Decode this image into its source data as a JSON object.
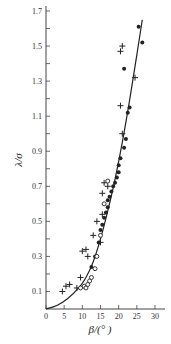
{
  "chart_data": {
    "type": "scatter",
    "title": "",
    "xlabel": "β/(°)",
    "ylabel": "λ/σ",
    "xlim": [
      0,
      32
    ],
    "ylim": [
      0,
      1.75
    ],
    "xticks": [
      0,
      5,
      10,
      15,
      20,
      25,
      30
    ],
    "yticks": [
      0.1,
      0.3,
      0.5,
      0.7,
      0.9,
      1.1,
      1.3,
      1.5,
      1.7
    ],
    "grid": false,
    "legend": null,
    "series": [
      {
        "name": "plus",
        "marker": "+",
        "points": [
          [
            4.5,
            0.1
          ],
          [
            5.5,
            0.13
          ],
          [
            6.5,
            0.14
          ],
          [
            8.5,
            0.12
          ],
          [
            9.5,
            0.18
          ],
          [
            10.0,
            0.33
          ],
          [
            11.0,
            0.34
          ],
          [
            11.5,
            0.3
          ],
          [
            13.0,
            0.42
          ],
          [
            14.0,
            0.5
          ],
          [
            15.5,
            0.54
          ],
          [
            15.5,
            0.66
          ],
          [
            17.0,
            0.7
          ],
          [
            21.0,
            1.0
          ],
          [
            20.5,
            1.16
          ],
          [
            20.5,
            1.47
          ],
          [
            21.0,
            1.5
          ],
          [
            24.5,
            1.32
          ],
          [
            15.0,
            0.38
          ],
          [
            16.0,
            0.72
          ]
        ]
      },
      {
        "name": "filled_circle",
        "marker": "●",
        "points": [
          [
            12.5,
            0.24
          ],
          [
            13.5,
            0.3
          ],
          [
            14.5,
            0.38
          ],
          [
            15.0,
            0.45
          ],
          [
            15.5,
            0.48
          ],
          [
            16.0,
            0.52
          ],
          [
            16.5,
            0.55
          ],
          [
            17.0,
            0.58
          ],
          [
            17.0,
            0.62
          ],
          [
            17.5,
            0.64
          ],
          [
            18.0,
            0.67
          ],
          [
            18.5,
            0.7
          ],
          [
            19.0,
            0.72
          ],
          [
            19.5,
            0.75
          ],
          [
            20.0,
            0.78
          ],
          [
            20.0,
            0.82
          ],
          [
            20.5,
            0.86
          ],
          [
            21.5,
            0.92
          ],
          [
            22.0,
            0.97
          ],
          [
            22.5,
            1.12
          ],
          [
            23.0,
            1.15
          ],
          [
            21.5,
            1.37
          ],
          [
            25.5,
            1.61
          ],
          [
            26.5,
            1.52
          ]
        ]
      },
      {
        "name": "open_circle",
        "marker": "○",
        "points": [
          [
            9.5,
            0.12
          ],
          [
            10.5,
            0.13
          ],
          [
            11.0,
            0.12
          ],
          [
            11.5,
            0.14
          ],
          [
            12.0,
            0.16
          ],
          [
            12.5,
            0.18
          ],
          [
            13.5,
            0.23
          ],
          [
            14.0,
            0.3
          ],
          [
            15.0,
            0.42
          ],
          [
            16.0,
            0.6
          ],
          [
            17.0,
            0.73
          ]
        ]
      }
    ],
    "fit_curve": {
      "name": "model curve",
      "points": [
        [
          0,
          0.0
        ],
        [
          3,
          0.02
        ],
        [
          6,
          0.06
        ],
        [
          9,
          0.12
        ],
        [
          11,
          0.18
        ],
        [
          13,
          0.27
        ],
        [
          15,
          0.4
        ],
        [
          17,
          0.56
        ],
        [
          19,
          0.74
        ],
        [
          21,
          0.95
        ],
        [
          23,
          1.19
        ],
        [
          25,
          1.45
        ],
        [
          26.5,
          1.65
        ]
      ]
    }
  },
  "labels": {
    "ylabel_num": "λ",
    "ylabel_den": "σ",
    "xlabel": "β/(°  )"
  }
}
